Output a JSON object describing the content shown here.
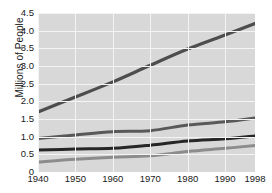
{
  "chart_data": {
    "type": "line",
    "title": "",
    "xlabel": "",
    "ylabel": "Millions of People",
    "xlim": [
      1940,
      1998
    ],
    "ylim": [
      0,
      4.5
    ],
    "grid": true,
    "legend": "none",
    "xticks": [
      "1940",
      "1950",
      "1960",
      "1970",
      "1980",
      "1990",
      "1998"
    ],
    "xtick_values": [
      1940,
      1950,
      1960,
      1970,
      1980,
      1990,
      1998
    ],
    "yticks": [
      "4.5",
      "4.0",
      "3.5",
      "3.0",
      "2.5",
      "2.0",
      "1.5",
      "1.0",
      "0.5",
      "0"
    ],
    "ytick_values": [
      4.5,
      4.0,
      3.5,
      3.0,
      2.5,
      2.0,
      1.5,
      1.0,
      0.5,
      0
    ],
    "x": [
      1940,
      1950,
      1960,
      1970,
      1980,
      1990,
      1998
    ],
    "series": [
      {
        "name": "series-1",
        "color": "#4d4d4d",
        "width": 3.2,
        "values": [
          1.7,
          2.12,
          2.55,
          3.02,
          3.48,
          3.88,
          4.2
        ]
      },
      {
        "name": "series-2",
        "color": "#595959",
        "width": 3.0,
        "values": [
          0.95,
          1.05,
          1.14,
          1.17,
          1.33,
          1.42,
          1.53
        ]
      },
      {
        "name": "series-3",
        "color": "#262626",
        "width": 3.0,
        "values": [
          0.62,
          0.65,
          0.67,
          0.76,
          0.88,
          0.94,
          1.02
        ]
      },
      {
        "name": "series-4",
        "color": "#8c8c8c",
        "width": 3.0,
        "values": [
          0.28,
          0.36,
          0.42,
          0.46,
          0.58,
          0.67,
          0.75
        ]
      }
    ],
    "colors": {
      "plot_background": "#d8d8d8",
      "grid": "#f4f4f4",
      "page_background": "#ffffff",
      "text": "#1a1a1a"
    }
  }
}
